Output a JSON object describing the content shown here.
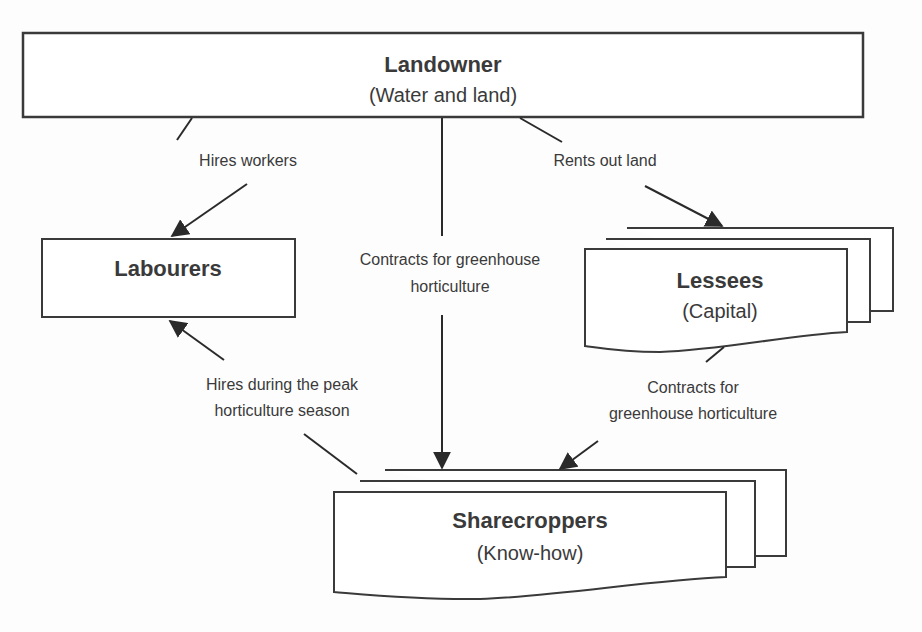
{
  "diagram": {
    "nodes": {
      "landowner": {
        "title": "Landowner",
        "subtitle": "(Water and land)"
      },
      "labourers": {
        "title": "Labourers"
      },
      "lessees": {
        "title": "Lessees",
        "subtitle": "(Capital)"
      },
      "sharecroppers": {
        "title": "Sharecroppers",
        "subtitle": "(Know-how)"
      }
    },
    "edges": {
      "hires_workers": {
        "from": "Landowner",
        "to": "Labourers",
        "label": "Hires workers"
      },
      "rents_out_land": {
        "from": "Landowner",
        "to": "Lessees",
        "label": "Rents out land"
      },
      "contracts_landowner": {
        "from": "Landowner",
        "to": "Sharecroppers",
        "label_line1": "Contracts for greenhouse",
        "label_line2": "horticulture"
      },
      "hires_peak": {
        "from": "Sharecroppers",
        "to": "Labourers",
        "label_line1": "Hires during the peak",
        "label_line2": "horticulture season"
      },
      "contracts_lessees": {
        "from": "Lessees",
        "to": "Sharecroppers",
        "label_line1": "Contracts for",
        "label_line2": "greenhouse horticulture"
      }
    },
    "colors": {
      "stroke": "#3a3a3a",
      "text": "#3a3a3a",
      "background": "#fdfdfd"
    }
  }
}
